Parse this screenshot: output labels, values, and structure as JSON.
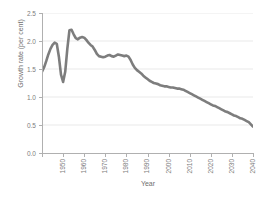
{
  "chart_data": {
    "type": "line",
    "title": "",
    "xlabel": "Year",
    "ylabel": "Growth rate (per cent)",
    "xlim": [
      1950,
      2050
    ],
    "ylim": [
      0.0,
      2.5
    ],
    "grid": true,
    "legend": null,
    "x_ticks": [
      "1950",
      "1960",
      "1970",
      "1980",
      "1990",
      "2000",
      "2010",
      "2020",
      "2030",
      "2040",
      "2050"
    ],
    "y_ticks": [
      "0.0",
      "0.5",
      "1.0",
      "1.5",
      "2.0",
      "2.5"
    ],
    "line_color": "#6b6b6b",
    "series": [
      {
        "name": "World population growth rate",
        "x": [
          1950,
          1951,
          1952,
          1953,
          1954,
          1955,
          1956,
          1957,
          1958,
          1959,
          1960,
          1961,
          1962,
          1963,
          1964,
          1965,
          1966,
          1967,
          1968,
          1969,
          1970,
          1971,
          1972,
          1973,
          1974,
          1975,
          1976,
          1977,
          1978,
          1979,
          1980,
          1981,
          1982,
          1983,
          1984,
          1985,
          1986,
          1987,
          1988,
          1989,
          1990,
          1991,
          1992,
          1993,
          1994,
          1995,
          1996,
          1997,
          1998,
          1999,
          2000,
          2001,
          2002,
          2003,
          2004,
          2005,
          2006,
          2007,
          2008,
          2009,
          2010,
          2011,
          2012,
          2013,
          2014,
          2015,
          2016,
          2017,
          2018,
          2019,
          2020,
          2021,
          2022,
          2023,
          2024,
          2025,
          2026,
          2027,
          2028,
          2029,
          2030,
          2031,
          2032,
          2033,
          2034,
          2035,
          2036,
          2037,
          2038,
          2039,
          2040,
          2041,
          2042,
          2043,
          2044,
          2045,
          2046,
          2047,
          2048,
          2049,
          2050
        ],
        "y": [
          1.45,
          1.53,
          1.64,
          1.76,
          1.86,
          1.93,
          1.97,
          1.95,
          1.72,
          1.4,
          1.27,
          1.45,
          1.86,
          2.19,
          2.2,
          2.12,
          2.05,
          2.03,
          2.06,
          2.07,
          2.06,
          2.02,
          1.97,
          1.93,
          1.9,
          1.84,
          1.77,
          1.73,
          1.72,
          1.71,
          1.72,
          1.74,
          1.75,
          1.73,
          1.72,
          1.74,
          1.76,
          1.75,
          1.74,
          1.73,
          1.74,
          1.72,
          1.66,
          1.58,
          1.52,
          1.48,
          1.45,
          1.42,
          1.38,
          1.35,
          1.32,
          1.29,
          1.27,
          1.25,
          1.24,
          1.23,
          1.21,
          1.2,
          1.19,
          1.19,
          1.18,
          1.17,
          1.17,
          1.16,
          1.15,
          1.15,
          1.14,
          1.13,
          1.11,
          1.09,
          1.07,
          1.05,
          1.03,
          1.01,
          0.99,
          0.97,
          0.95,
          0.93,
          0.91,
          0.89,
          0.87,
          0.85,
          0.84,
          0.82,
          0.8,
          0.78,
          0.76,
          0.74,
          0.73,
          0.71,
          0.69,
          0.67,
          0.66,
          0.64,
          0.62,
          0.61,
          0.59,
          0.57,
          0.55,
          0.51,
          0.47
        ]
      }
    ]
  },
  "axes": {
    "y_title": "Growth rate (per cent)",
    "x_title": "Year"
  }
}
